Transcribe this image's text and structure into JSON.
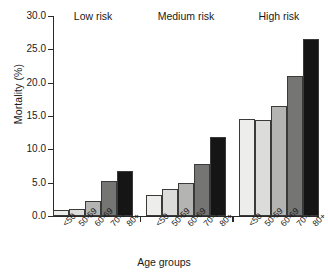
{
  "chart_data": {
    "type": "bar",
    "title": "",
    "xlabel": "Age groups",
    "ylabel": "Mortality (%)",
    "ylim": [
      0,
      30
    ],
    "ytick_labels": [
      "0.0",
      "5.0",
      "10.0",
      "15.0",
      "20.0",
      "25.0",
      "30.0"
    ],
    "ytick_values": [
      0,
      5,
      10,
      15,
      20,
      25,
      30
    ],
    "grid": false,
    "legend_position": "none",
    "categories": [
      "<50",
      "50-59",
      "60-69",
      "70-79",
      "80+"
    ],
    "groups": [
      "Low risk",
      "Medium risk",
      "High risk"
    ],
    "series": [
      {
        "name": "Low risk",
        "values": [
          0.9,
          1.1,
          2.3,
          5.2,
          6.8
        ]
      },
      {
        "name": "Medium risk",
        "values": [
          3.1,
          4.1,
          5.0,
          7.8,
          11.8
        ]
      },
      {
        "name": "High risk",
        "values": [
          14.5,
          14.4,
          16.5,
          21.0,
          26.5
        ]
      }
    ],
    "category_colors": [
      "#ededeb",
      "#dcdcda",
      "#b4b4b2",
      "#757573",
      "#151515"
    ],
    "bar_edge_color": "#3a3a3a",
    "axis_color": "#2a2a2a"
  }
}
